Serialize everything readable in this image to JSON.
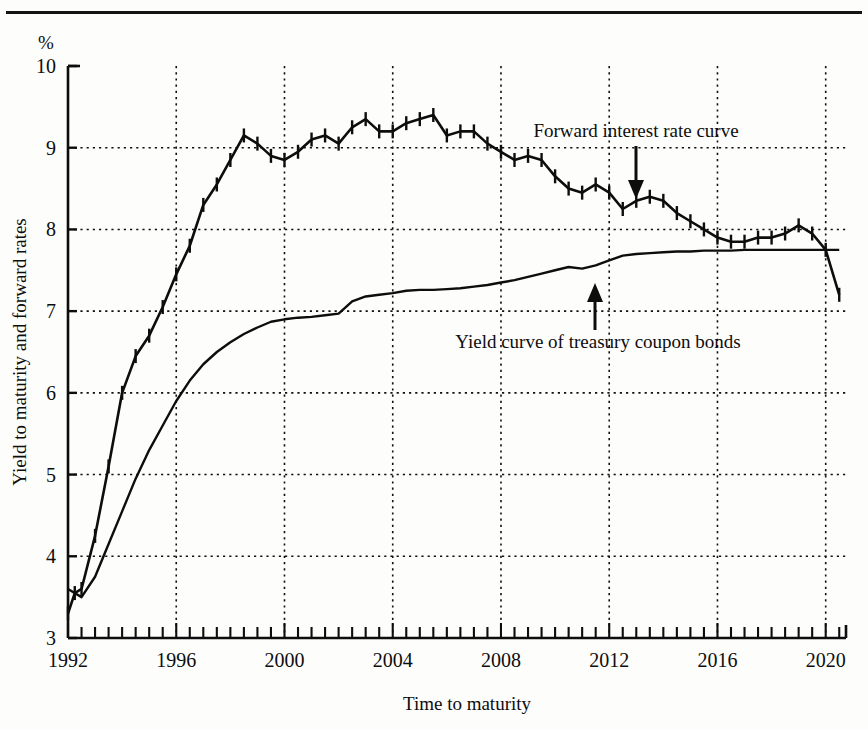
{
  "figure": {
    "unit_label": "%",
    "y_axis_title": "Yield to maturity and forward rates",
    "x_axis_title": "Time to maturity"
  },
  "annotations": {
    "forward": {
      "label": "Forward interest rate curve",
      "arrow": "arrow-down-icon"
    },
    "yield": {
      "label": "Yield curve of treasury coupon bonds",
      "arrow": "arrow-up-icon"
    }
  },
  "chart_data": {
    "type": "line",
    "title": "",
    "xlabel": "Time to maturity",
    "ylabel": "Yield to maturity and forward rates",
    "unit": "%",
    "xlim": [
      1992,
      2020.75
    ],
    "ylim": [
      3,
      10
    ],
    "yticks": [
      3,
      4,
      5,
      6,
      7,
      8,
      9,
      10
    ],
    "ytick_labels": [
      "3",
      "4",
      "5",
      "6",
      "7",
      "8",
      "9",
      "10"
    ],
    "xticks": [
      1992,
      1996,
      2000,
      2004,
      2008,
      2012,
      2016,
      2020
    ],
    "xtick_labels": [
      "1992",
      "1996",
      "2000",
      "2004",
      "2008",
      "2012",
      "2016",
      "2020"
    ],
    "minor_xtick_interval": 0.5,
    "grid": "dotted-both-at-major-ticks",
    "legend": "inline-annotations",
    "series": [
      {
        "name": "Forward interest rate curve",
        "marker": "vertical-tick",
        "x": [
          1992.0,
          1992.25,
          1992.5,
          1993.0,
          1993.5,
          1994.0,
          1994.5,
          1995.0,
          1995.5,
          1996.0,
          1996.5,
          1997.0,
          1997.5,
          1998.0,
          1998.5,
          1999.0,
          1999.5,
          2000.0,
          2000.5,
          2001.0,
          2001.5,
          2002.0,
          2002.5,
          2003.0,
          2003.5,
          2004.0,
          2004.5,
          2005.0,
          2005.5,
          2006.0,
          2006.5,
          2007.0,
          2007.5,
          2008.0,
          2008.5,
          2009.0,
          2009.5,
          2010.0,
          2010.5,
          2011.0,
          2011.5,
          2012.0,
          2012.5,
          2013.0,
          2013.5,
          2014.0,
          2014.5,
          2015.0,
          2015.5,
          2016.0,
          2016.5,
          2017.0,
          2017.5,
          2018.0,
          2018.5,
          2019.0,
          2019.5,
          2020.0,
          2020.5
        ],
        "y": [
          3.3,
          3.55,
          3.6,
          4.25,
          5.1,
          6.0,
          6.45,
          6.7,
          7.05,
          7.45,
          7.8,
          8.3,
          8.55,
          8.85,
          9.15,
          9.05,
          8.9,
          8.85,
          8.95,
          9.1,
          9.15,
          9.05,
          9.25,
          9.35,
          9.2,
          9.2,
          9.3,
          9.35,
          9.4,
          9.15,
          9.2,
          9.2,
          9.05,
          8.95,
          8.85,
          8.9,
          8.85,
          8.65,
          8.5,
          8.45,
          8.55,
          8.45,
          8.25,
          8.35,
          8.4,
          8.35,
          8.2,
          8.1,
          8.0,
          7.9,
          7.85,
          7.85,
          7.9,
          7.9,
          7.95,
          8.05,
          7.95,
          7.75,
          7.2
        ]
      },
      {
        "name": "Yield curve of treasury coupon bonds",
        "marker": "none",
        "x": [
          1992.0,
          1992.5,
          1993.0,
          1993.5,
          1994.0,
          1994.5,
          1995.0,
          1995.5,
          1996.0,
          1996.5,
          1997.0,
          1997.5,
          1998.0,
          1998.5,
          1999.0,
          1999.5,
          2000.0,
          2000.5,
          2001.0,
          2001.5,
          2002.0,
          2002.5,
          2003.0,
          2003.5,
          2004.0,
          2004.5,
          2005.0,
          2005.5,
          2006.0,
          2006.5,
          2007.0,
          2007.5,
          2008.0,
          2008.5,
          2009.0,
          2009.5,
          2010.0,
          2010.5,
          2011.0,
          2011.5,
          2012.0,
          2012.5,
          2013.0,
          2013.5,
          2014.0,
          2014.5,
          2015.0,
          2015.5,
          2016.0,
          2016.5,
          2017.0,
          2017.5,
          2018.0,
          2018.5,
          2019.0,
          2019.5,
          2020.0,
          2020.5
        ],
        "y": [
          3.6,
          3.5,
          3.75,
          4.15,
          4.55,
          4.95,
          5.3,
          5.6,
          5.9,
          6.15,
          6.35,
          6.5,
          6.62,
          6.72,
          6.8,
          6.87,
          6.9,
          6.92,
          6.93,
          6.95,
          6.97,
          7.12,
          7.18,
          7.2,
          7.22,
          7.25,
          7.26,
          7.26,
          7.27,
          7.28,
          7.3,
          7.32,
          7.35,
          7.38,
          7.42,
          7.46,
          7.5,
          7.54,
          7.52,
          7.56,
          7.62,
          7.68,
          7.7,
          7.71,
          7.72,
          7.73,
          7.73,
          7.74,
          7.74,
          7.74,
          7.75,
          7.75,
          7.75,
          7.75,
          7.75,
          7.75,
          7.75,
          7.75
        ]
      }
    ]
  }
}
